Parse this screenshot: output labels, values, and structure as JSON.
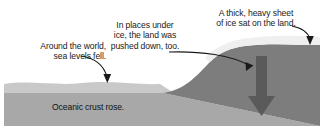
{
  "figure": {
    "annotations": [
      {
        "id": "sea-levels",
        "text": "Around the world,\nsea levels fell.",
        "pointer": "curved-arrow-down-right"
      },
      {
        "id": "land-pushed-down",
        "text": "In places under\nice, the land was\npushed down, too.",
        "pointer": "curved-arrow-right-down"
      },
      {
        "id": "ice-sheet",
        "text": "A thick, heavy sheet\nof ice sat on the land.",
        "pointer": "curved-arrow-down-right"
      }
    ],
    "inline_labels": [
      {
        "id": "oceanic-crust",
        "text": "Oceanic crust rose."
      }
    ],
    "layers": [
      {
        "id": "ocean-water",
        "name": "Ocean water / sea surface",
        "color": "#c9c9c9"
      },
      {
        "id": "oceanic-crust",
        "name": "Oceanic crust",
        "color": "#a8a8a8"
      },
      {
        "id": "land-mass",
        "name": "Land mass",
        "color": "#7d7d7d"
      },
      {
        "id": "ice-sheet",
        "name": "Ice sheet",
        "color": "#efefef"
      }
    ],
    "arrows": [
      {
        "id": "sea-level-arrow",
        "color": "#1a1a1a",
        "style": "thin-curved"
      },
      {
        "id": "land-push-arrow",
        "color": "#1a1a1a",
        "style": "thin-curved"
      },
      {
        "id": "ice-sheet-arrow",
        "color": "#1a1a1a",
        "style": "thin-curved"
      },
      {
        "id": "downward-pressure-arrow",
        "color": "#5a5a5a",
        "style": "thick-block"
      }
    ],
    "colors": {
      "background": "#ffffff",
      "text": "#1a1a1a",
      "water": "#c9c9c9",
      "crust": "#a8a8a8",
      "land": "#7d7d7d",
      "ice": "#efefef",
      "arrow": "#1a1a1a",
      "pressure_arrow": "#5a5a5a"
    }
  }
}
